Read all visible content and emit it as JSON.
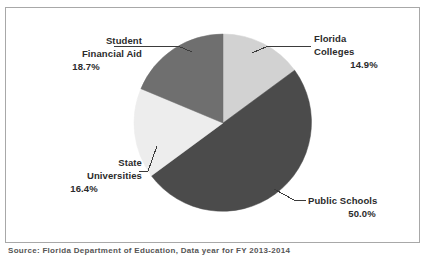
{
  "frame": {
    "border_color": "#a8a8a8",
    "background": "#ffffff"
  },
  "source_note": "Source:  Florida Department of Education, Data year for FY 2013-2014",
  "callouts": {
    "student_financial_aid": {
      "line1": "Student",
      "line2": "Financial Aid",
      "percent": "18.7%"
    },
    "florida_colleges": {
      "line1": "Florida",
      "line2": "Colleges",
      "percent": "14.9%"
    },
    "state_universities": {
      "line1": "State",
      "line2": "Universities",
      "percent": "16.4%"
    },
    "public_schools": {
      "line1": "Public Schools",
      "percent": "50.0%"
    }
  },
  "chart_data": {
    "type": "pie",
    "title": "",
    "subtitle": "",
    "xlabel": "",
    "ylabel": "",
    "legend": "none",
    "labels_position": "outside-callout",
    "start_angle_deg": 0,
    "direction": "clockwise",
    "units": "percent",
    "total": 100.0,
    "categories": [
      "Florida Colleges",
      "Public Schools",
      "State Universities",
      "Student Financial Aid"
    ],
    "values": [
      14.9,
      50.0,
      16.4,
      18.7
    ],
    "colors": [
      "#d2d2d2",
      "#4b4b4b",
      "#ededed",
      "#6f6f6f"
    ],
    "slices": [
      {
        "label": "Florida Colleges",
        "value": 14.9,
        "display": "14.9%",
        "color": "#d2d2d2"
      },
      {
        "label": "Public Schools",
        "value": 50.0,
        "display": "50.0%",
        "color": "#4b4b4b"
      },
      {
        "label": "State Universities",
        "value": 16.4,
        "display": "16.4%",
        "color": "#ededed"
      },
      {
        "label": "Student Financial Aid",
        "value": 18.7,
        "display": "18.7%",
        "color": "#6f6f6f"
      }
    ]
  }
}
